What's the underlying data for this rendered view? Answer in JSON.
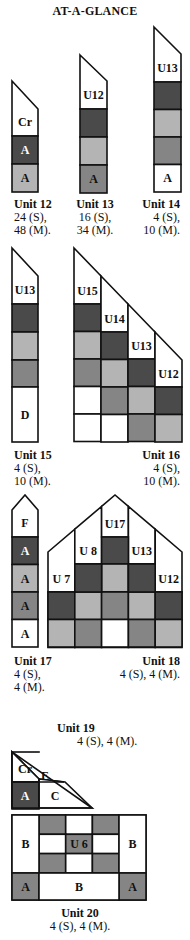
{
  "title": "AT-A-GLANCE",
  "colors": {
    "dark": "#4a4a4a",
    "medium": "#858585",
    "light": "#b4b4b4",
    "white": "#ffffff",
    "stroke": "#111111"
  },
  "units": [
    {
      "id": "unit12",
      "name": "Unit 12",
      "qty_line1": "24 (S),",
      "qty_line2": "48 (M).",
      "cells": [
        {
          "label": "Cr",
          "shade": "white"
        },
        {
          "label": "A",
          "shade": "dark"
        },
        {
          "label": "A",
          "shade": "light"
        }
      ]
    },
    {
      "id": "unit13",
      "name": "Unit 13",
      "qty_line1": "16 (S),",
      "qty_line2": "34 (M).",
      "cells": [
        {
          "label": "U12",
          "shade": "white"
        },
        {
          "label": "",
          "shade": "dark"
        },
        {
          "label": "",
          "shade": "light"
        },
        {
          "label": "A",
          "shade": "medium"
        }
      ]
    },
    {
      "id": "unit14",
      "name": "Unit 14",
      "qty_line1": "4 (S),",
      "qty_line2": "10 (M).",
      "cells": [
        {
          "label": "U13",
          "shade": "white"
        },
        {
          "label": "",
          "shade": "dark"
        },
        {
          "label": "",
          "shade": "light"
        },
        {
          "label": "",
          "shade": "medium"
        },
        {
          "label": "A",
          "shade": "white"
        }
      ]
    },
    {
      "id": "unit15",
      "name": "Unit 15",
      "qty_line1": "4 (S),",
      "qty_line2": "10 (M).",
      "cells": [
        {
          "label": "U13",
          "shade": "white"
        },
        {
          "label": "",
          "shade": "dark"
        },
        {
          "label": "",
          "shade": "light"
        },
        {
          "label": "",
          "shade": "medium"
        },
        {
          "label": "D",
          "shade": "white"
        }
      ]
    },
    {
      "id": "unit16",
      "name": "Unit 16",
      "qty_line1": "4 (S),",
      "qty_line2": "10 (M).",
      "top_labels": [
        "U15",
        "U14",
        "U13",
        "U12"
      ],
      "grid": [
        [
          "dark",
          "white",
          "white",
          "white"
        ],
        [
          "light",
          "dark",
          "white",
          "white"
        ],
        [
          "medium",
          "light",
          "dark",
          "white"
        ],
        [
          "white",
          "medium",
          "light",
          "dark"
        ],
        [
          "white",
          "white",
          "medium",
          "light"
        ]
      ]
    },
    {
      "id": "unit17",
      "name": "Unit 17",
      "qty_line1": "4 (S),",
      "qty_line2": "4 (M).",
      "cells": [
        {
          "label": "F",
          "shade": "white"
        },
        {
          "label": "A",
          "shade": "dark"
        },
        {
          "label": "A",
          "shade": "light"
        },
        {
          "label": "A",
          "shade": "medium"
        },
        {
          "label": "A",
          "shade": "white"
        }
      ]
    },
    {
      "id": "unit18",
      "name": "Unit 18",
      "qty": "4 (S), 4 (M).",
      "top_labels": [
        "U 7",
        "U 8",
        "U17",
        "U13",
        "U12"
      ],
      "grid": [
        [
          "white",
          "dark",
          "light",
          "dark",
          "white"
        ],
        [
          "dark",
          "light",
          "medium",
          "light",
          "dark"
        ],
        [
          "light",
          "medium",
          "white",
          "medium",
          "light"
        ]
      ]
    },
    {
      "id": "unit19",
      "name": "Unit 19",
      "qty": "4 (S), 4 (M).",
      "cells": [
        {
          "label": "Cr",
          "shade": "white"
        },
        {
          "label": "E",
          "shade": "white"
        },
        {
          "label": "A",
          "shade": "dark"
        },
        {
          "label": "C",
          "shade": "white"
        }
      ]
    },
    {
      "id": "unit20",
      "name": "Unit 20",
      "qty": "4 (S), 4 (M).",
      "center_label": "U 6",
      "side_label": "B",
      "corner_label": "A",
      "bottom_label": "B"
    }
  ]
}
